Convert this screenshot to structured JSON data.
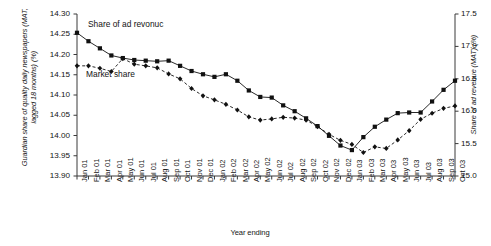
{
  "chart_data": {
    "type": "line",
    "title": "",
    "xlabel": "Year ending",
    "ylabel": "Guardian share of quality daily newspapers (MAT, lagged 18 months) (%)",
    "ylabel_right": "Share of ad revenue (MAT) (%)",
    "grid": false,
    "legend_position": "inline-annotations",
    "categories": [
      "Jan 01",
      "Feb 01",
      "Mar 01",
      "Apr 01",
      "May 01",
      "Jun 01",
      "Jul 01",
      "Aug 01",
      "Sep 01",
      "Oct 01",
      "Nov 01",
      "Dec 01",
      "Jan 02",
      "Feb 02",
      "Mar 02",
      "Apr 02",
      "May 02",
      "Jun 02",
      "Jul 02",
      "Aug 02",
      "Sep 02",
      "Oct 02",
      "Nov 02",
      "Dec 02",
      "Jan 03",
      "Feb 03",
      "Mar 03",
      "Apr 03",
      "May 03",
      "Jun 03",
      "Jul 03",
      "Aug 03",
      "Sep 03",
      "Oct 03"
    ],
    "ylim": [
      13.9,
      14.3
    ],
    "yticks": [
      "13.90",
      "13.95",
      "14.00",
      "14.05",
      "14.10",
      "14.15",
      "14.20",
      "14.25",
      "14.30"
    ],
    "ylim_right": [
      15.0,
      17.5
    ],
    "yticks_right": [
      "15.0",
      "15.5",
      "16.0",
      "16.5",
      "17.0",
      "17.5"
    ],
    "series": [
      {
        "name": "Share of ad revenue",
        "axis": "right",
        "line_style": "solid",
        "marker": "square",
        "color": "#111111",
        "values": [
          17.21,
          17.08,
          16.97,
          16.86,
          16.82,
          16.79,
          16.78,
          16.77,
          16.78,
          16.7,
          16.62,
          16.57,
          16.53,
          16.57,
          16.47,
          16.32,
          16.22,
          16.21,
          16.09,
          16.0,
          15.89,
          15.77,
          15.62,
          15.47,
          15.4,
          15.6,
          15.76,
          15.87,
          15.97,
          15.98,
          15.98,
          16.15,
          16.33,
          16.47
        ]
      },
      {
        "name": "Market share",
        "axis": "left",
        "line_style": "dashed",
        "marker": "diamond",
        "color": "#111111",
        "values": [
          14.172,
          14.172,
          14.166,
          14.158,
          14.19,
          14.176,
          14.172,
          14.167,
          14.152,
          14.14,
          14.116,
          14.098,
          14.088,
          14.077,
          14.063,
          14.046,
          14.038,
          14.041,
          14.045,
          14.043,
          14.038,
          14.022,
          14.003,
          13.988,
          13.978,
          13.958,
          13.972,
          13.968,
          13.989,
          14.012,
          14.04,
          14.055,
          14.067,
          14.073
        ]
      }
    ],
    "annotations": [
      {
        "name": "ad-revenue-label",
        "text": "Share of ad revonuc"
      },
      {
        "name": "market-share-label",
        "text": "Market share"
      }
    ]
  }
}
